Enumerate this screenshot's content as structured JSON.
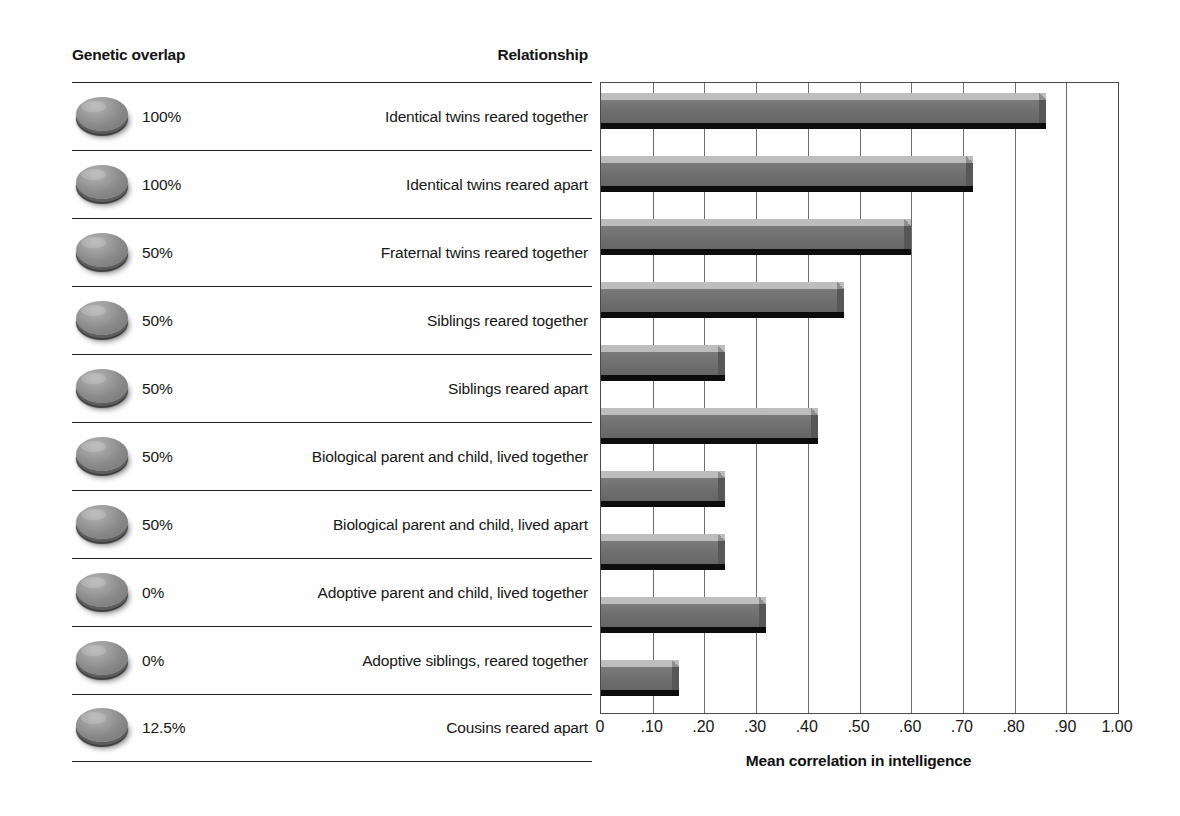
{
  "table": {
    "header_genetic": "Genetic overlap",
    "header_relationship": "Relationship",
    "rows": [
      {
        "genetic_overlap": "100%",
        "relationship": "Identical twins reared together"
      },
      {
        "genetic_overlap": "100%",
        "relationship": "Identical twins reared apart"
      },
      {
        "genetic_overlap": "50%",
        "relationship": "Fraternal twins reared together"
      },
      {
        "genetic_overlap": "50%",
        "relationship": "Siblings reared together"
      },
      {
        "genetic_overlap": "50%",
        "relationship": "Siblings reared apart"
      },
      {
        "genetic_overlap": "50%",
        "relationship": "Biological parent and child, lived together"
      },
      {
        "genetic_overlap": "50%",
        "relationship": "Biological parent and child, lived apart"
      },
      {
        "genetic_overlap": "0%",
        "relationship": "Adoptive parent and child, lived together"
      },
      {
        "genetic_overlap": "0%",
        "relationship": "Adoptive siblings, reared together"
      },
      {
        "genetic_overlap": "12.5%",
        "relationship": "Cousins reared apart"
      }
    ]
  },
  "chart_data": {
    "type": "bar",
    "orientation": "horizontal",
    "title": "",
    "xlabel": "Mean correlation in intelligence",
    "ylabel": "",
    "xlim": [
      0,
      1.0
    ],
    "grid": true,
    "legend": null,
    "tick_labels": [
      "0",
      ".10",
      ".20",
      ".30",
      ".40",
      ".50",
      ".60",
      ".70",
      ".80",
      ".90",
      "1.00"
    ],
    "tick_values": [
      0,
      0.1,
      0.2,
      0.3,
      0.4,
      0.5,
      0.6,
      0.7,
      0.8,
      0.9,
      1.0
    ],
    "categories": [
      "Identical twins reared together",
      "Identical twins reared apart",
      "Fraternal twins reared together",
      "Siblings reared together",
      "Siblings reared apart",
      "Biological parent and child, lived together",
      "Biological parent and child, lived apart",
      "Adoptive parent and child, lived together",
      "Adoptive siblings, reared together",
      "Cousins reared apart"
    ],
    "values": [
      0.86,
      0.72,
      0.6,
      0.47,
      0.24,
      0.42,
      0.24,
      0.24,
      0.32,
      0.15
    ]
  },
  "colors": {
    "bar_body": "#6e6e6e",
    "bar_top_bevel": "#bdbdbd",
    "bar_shadow": "#0d0d0d",
    "gridline": "#6d6d6d",
    "rule": "#1d1d1d",
    "text": "#161616",
    "background": "#fefefe"
  }
}
